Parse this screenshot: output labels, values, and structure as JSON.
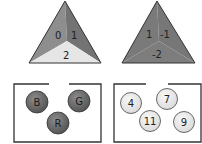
{
  "triangles": [
    {
      "id": "left",
      "faces": [
        {
          "position": "left",
          "label": "0",
          "color": "#8e8e8e"
        },
        {
          "position": "right",
          "label": "1",
          "color": "#737373"
        },
        {
          "position": "bottom",
          "label": "2",
          "color": "#e6e6e6"
        }
      ]
    },
    {
      "id": "right",
      "faces": [
        {
          "position": "left",
          "label": "1",
          "color": "#7a7a7a"
        },
        {
          "position": "right",
          "label": "-1",
          "color": "#777777"
        },
        {
          "position": "bottom",
          "label": "-2",
          "color": "#7d7d7d"
        }
      ]
    }
  ],
  "boxes": [
    {
      "id": "left",
      "balls": [
        {
          "label": "B",
          "color": "#6a6a6a"
        },
        {
          "label": "G",
          "color": "#6a6a6a"
        },
        {
          "label": "R",
          "color": "#6a6a6a"
        }
      ]
    },
    {
      "id": "right",
      "balls": [
        {
          "label": "4",
          "color": "#e6e6e6"
        },
        {
          "label": "7",
          "color": "#e6e6e6"
        },
        {
          "label": "11",
          "color": "#e6e6e6"
        },
        {
          "label": "9",
          "color": "#e6e6e6"
        }
      ]
    }
  ],
  "colors": {
    "outline": "#333333",
    "ball_dark": "#6a6a6a",
    "ball_light": "#e6e6e6"
  }
}
